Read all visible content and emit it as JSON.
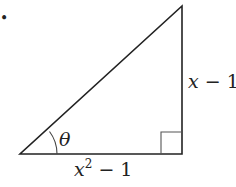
{
  "diagram": {
    "type": "right-triangle",
    "angle_label": "θ",
    "vertical_side": {
      "var": "x",
      "rest": " − 1"
    },
    "horizontal_side": {
      "var": "x",
      "sup": "2",
      "rest": " − 1"
    },
    "bullet": "•"
  }
}
